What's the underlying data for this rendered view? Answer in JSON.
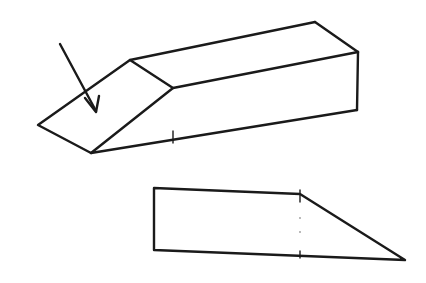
{
  "figure": {
    "stroke_color": "#1a1a1a",
    "background": "#ffffff"
  },
  "perspective_view": {
    "arrow": {
      "from": [
        60,
        44
      ],
      "to": [
        96,
        112
      ]
    },
    "slanted_face": [
      [
        38,
        125
      ],
      [
        130,
        60
      ],
      [
        173,
        88
      ],
      [
        91,
        153
      ]
    ],
    "top_back_edge": [
      [
        130,
        60
      ],
      [
        315,
        22
      ]
    ],
    "top_right_edge": [
      [
        315,
        22
      ],
      [
        358,
        52
      ]
    ],
    "front_top_edge": [
      [
        173,
        88
      ],
      [
        358,
        52
      ]
    ],
    "front_right_edge": [
      [
        358,
        52
      ],
      [
        357,
        110
      ]
    ],
    "bottom_edge": [
      [
        91,
        153
      ],
      [
        357,
        110
      ]
    ],
    "tick_mark": [
      173,
      137
    ]
  },
  "side_view": {
    "outline": [
      [
        154,
        188
      ],
      [
        300,
        194
      ],
      [
        405,
        260
      ],
      [
        154,
        250
      ]
    ],
    "dotted_divider_x": 300,
    "dotted_divider_range": [
      194,
      256
    ]
  }
}
